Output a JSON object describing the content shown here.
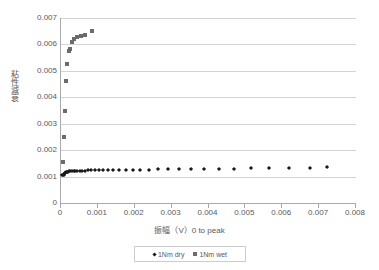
{
  "chart_data": {
    "type": "scatter",
    "title": "",
    "xlabel": "振幅（V）0 to peak",
    "ylabel": "粘性減衰",
    "xlim": [
      0,
      0.008
    ],
    "ylim": [
      0,
      0.007
    ],
    "xticks": [
      "0",
      "0.001",
      "0.002",
      "0.003",
      "0.004",
      "0.005",
      "0.006",
      "0.007",
      "0.008"
    ],
    "xtick_values": [
      0,
      0.001,
      0.002,
      0.003,
      0.004,
      0.005,
      0.006,
      0.007,
      0.008
    ],
    "yticks": [
      "0",
      "0.001",
      "0.002",
      "0.003",
      "0.004",
      "0.005",
      "0.006",
      "0.007"
    ],
    "ytick_values": [
      0,
      0.001,
      0.002,
      0.003,
      0.004,
      0.005,
      0.006,
      0.007
    ],
    "grid": "horizontal",
    "legend_position": "bottom",
    "series": [
      {
        "name": "1Nm dry",
        "marker": "diamond",
        "color": "#1a1a1a",
        "points": [
          [
            4e-05,
            0.001055
          ],
          [
            5.5e-05,
            0.001045
          ],
          [
            7e-05,
            0.00106
          ],
          [
            8.5e-05,
            0.00109
          ],
          [
            0.0001,
            0.00112
          ],
          [
            0.00012,
            0.001145
          ],
          [
            0.00014,
            0.001165
          ],
          [
            0.000165,
            0.00118
          ],
          [
            0.00019,
            0.00119
          ],
          [
            0.00022,
            0.001198
          ],
          [
            0.000255,
            0.001203
          ],
          [
            0.000295,
            0.001208
          ],
          [
            0.00034,
            0.001212
          ],
          [
            0.00039,
            0.001216
          ],
          [
            0.000445,
            0.001219
          ],
          [
            0.000505,
            0.001222
          ],
          [
            0.00057,
            0.001225
          ],
          [
            0.000645,
            0.001228
          ],
          [
            0.000725,
            0.001231
          ],
          [
            0.000815,
            0.001234
          ],
          [
            0.000915,
            0.001237
          ],
          [
            0.001025,
            0.00124
          ],
          [
            0.001145,
            0.001243
          ],
          [
            0.001275,
            0.001246
          ],
          [
            0.00142,
            0.001249
          ],
          [
            0.00158,
            0.001252
          ],
          [
            0.001755,
            0.001256
          ],
          [
            0.001945,
            0.001259
          ],
          [
            0.002155,
            0.001263
          ],
          [
            0.002385,
            0.001267
          ],
          [
            0.002635,
            0.001271
          ],
          [
            0.00291,
            0.001276
          ],
          [
            0.00321,
            0.001281
          ],
          [
            0.003535,
            0.001286
          ],
          [
            0.00389,
            0.001292
          ],
          [
            0.004275,
            0.001298
          ],
          [
            0.004695,
            0.001305
          ],
          [
            0.00515,
            0.001313
          ],
          [
            0.005645,
            0.001322
          ],
          [
            0.00618,
            0.001332
          ],
          [
            0.00676,
            0.001343
          ],
          [
            0.0072,
            0.001355
          ]
        ]
      },
      {
        "name": "1Nm wet",
        "marker": "square",
        "color": "#6b6b6b",
        "points": [
          [
            5.5e-05,
            0.00156
          ],
          [
            7.5e-05,
            0.0025
          ],
          [
            9.5e-05,
            0.00348
          ],
          [
            0.000125,
            0.0046
          ],
          [
            0.000165,
            0.00527
          ],
          [
            0.000225,
            0.00576
          ],
          [
            0.00025,
            0.00584
          ],
          [
            0.0003,
            0.00608
          ],
          [
            0.000355,
            0.00619
          ],
          [
            0.00043,
            0.00629
          ],
          [
            0.00053,
            0.00632
          ],
          [
            0.00066,
            0.00637
          ],
          [
            0.00083,
            0.00652
          ]
        ]
      }
    ]
  },
  "legend": {
    "entries": [
      {
        "label": "1Nm dry"
      },
      {
        "label": "1Nm wet"
      }
    ]
  }
}
